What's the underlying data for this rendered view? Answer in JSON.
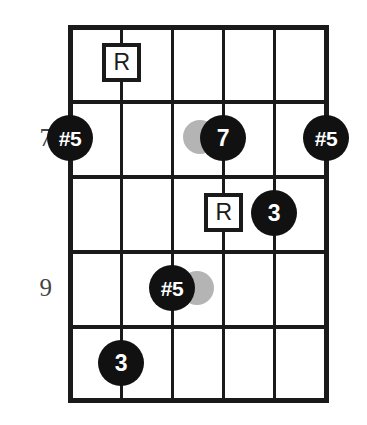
{
  "diagram": {
    "kind": "guitar-fretboard-chord-diagram",
    "title": "",
    "strings": 6,
    "frets": 5,
    "colors": {
      "grid": "#1a1a1a",
      "marker_fill": "#111111",
      "marker_text": "#ffffff",
      "square_outline": "#1a1a1a",
      "square_text": "#1a1a1a",
      "ghost": "#b4b4b4",
      "fret_number": "#444444",
      "background": "#ffffff"
    }
  },
  "fret_numbers": [
    {
      "label": "7",
      "fret_row": 2
    },
    {
      "label": "9",
      "fret_row": 4
    }
  ],
  "markers": [
    {
      "id": "m1",
      "label": "R",
      "shape": "square",
      "string": 2,
      "fret_row": 1
    },
    {
      "id": "m2",
      "label": "#5",
      "shape": "circle",
      "string": 1,
      "fret_row": 2
    },
    {
      "id": "m3",
      "label": "7",
      "shape": "circle",
      "string": 4,
      "fret_row": 2
    },
    {
      "id": "m4",
      "label": "#5",
      "shape": "circle",
      "string": 6,
      "fret_row": 2
    },
    {
      "id": "m5",
      "label": "R",
      "shape": "square",
      "string": 4,
      "fret_row": 3
    },
    {
      "id": "m6",
      "label": "3",
      "shape": "circle",
      "string": 5,
      "fret_row": 3
    },
    {
      "id": "m7",
      "label": "#5",
      "shape": "circle",
      "string": 3,
      "fret_row": 4
    },
    {
      "id": "m8",
      "label": "3",
      "shape": "circle",
      "string": 2,
      "fret_row": 5
    }
  ],
  "ghost_dots": [
    {
      "id": "g1",
      "near": "m3",
      "side": "left"
    },
    {
      "id": "g2",
      "near": "m7",
      "side": "right"
    }
  ]
}
